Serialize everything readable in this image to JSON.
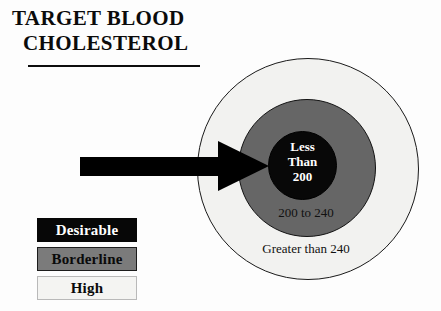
{
  "title": {
    "line1": "TARGET BLOOD",
    "line2": "CHOLESTEROL"
  },
  "diagram": {
    "type": "concentric-target",
    "rings": [
      {
        "id": "outer",
        "label": "Greater than 240",
        "category": "High",
        "fill": "#f2f2f0",
        "stroke": "#1a1a1a",
        "text_color": "#111111",
        "diameter_px": 222
      },
      {
        "id": "middle",
        "label": "200 to 240",
        "category": "Borderline",
        "fill": "#666666",
        "stroke": "#131313",
        "text_color": "#111111",
        "diameter_px": 138
      },
      {
        "id": "inner",
        "label_lines": [
          "Less",
          "Than",
          "200"
        ],
        "label": "Less Than 200",
        "category": "Desirable",
        "fill": "#080808",
        "stroke": "#000000",
        "text_color": "#ffffff",
        "diameter_px": 69
      }
    ],
    "pointer": {
      "icon": "right-arrow-icon",
      "points_to": "inner",
      "color": "#000000"
    }
  },
  "legend": {
    "items": [
      {
        "label": "Desirable",
        "swatch": "#070707",
        "text_color": "#ffffff"
      },
      {
        "label": "Borderline",
        "swatch": "#7b7b7b",
        "text_color": "#0a0a0a"
      },
      {
        "label": "High",
        "swatch": "#f4f4f2",
        "text_color": "#0a0a0a"
      }
    ]
  },
  "chart_data": {
    "type": "pie",
    "title": "TARGET BLOOD CHOLESTEROL",
    "xlabel": "",
    "ylabel": "",
    "categories": [
      "Desirable",
      "Borderline",
      "High"
    ],
    "labels": [
      "Less Than 200",
      "200 to 240",
      "Greater than 240"
    ],
    "values": [
      69,
      138,
      222
    ],
    "value_unit": "ring diameter (px)",
    "legend_position": "bottom-left",
    "grid": false,
    "annotations": [
      "Arrow points to the Desirable (Less Than 200) center ring"
    ]
  }
}
